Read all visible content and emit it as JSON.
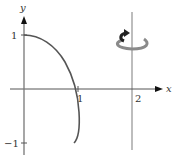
{
  "diagram": {
    "type": "solid-of-revolution-sketch",
    "axes": {
      "x_label": "x",
      "y_label": "y",
      "x_ticks": [
        "1",
        "2"
      ],
      "y_ticks": [
        "1",
        "−1"
      ]
    },
    "curve": {
      "description": "curve from (0,1) to (1,-1), crossing x-axis near x=1",
      "color": "#555555"
    },
    "axis_of_rotation": {
      "x": "2",
      "color": "#999999"
    },
    "rotation_icon": {
      "name": "rotation-arrow-icon",
      "color": "#888888",
      "arrow_color": "#222222"
    }
  }
}
